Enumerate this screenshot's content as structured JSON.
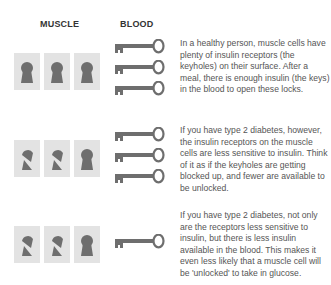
{
  "headers": {
    "muscle": "MUSCLE",
    "blood": "BLOOD"
  },
  "colors": {
    "keyhole": "#6e6e6e",
    "tile": "#e3e3e3",
    "key": "#6e6e6e",
    "text": "#555555"
  },
  "rows": [
    {
      "label": "healthy",
      "keyholes": [
        "open",
        "open",
        "open"
      ],
      "key_count": 3,
      "text": "In a healthy person, muscle cells have plenty of insulin receptors (the keyholes) on their surface. After a meal, there is enough insulin (the keys) in the blood to open these locks."
    },
    {
      "label": "type-2-insulin-resistance",
      "keyholes": [
        "blocked",
        "blocked",
        "open"
      ],
      "key_count": 3,
      "text": "If you have type 2 diabetes, however, the insulin receptors on the muscle cells are less sensitive to insulin. Think of it as if the keyholes are getting blocked up, and fewer are available to be unlocked."
    },
    {
      "label": "type-2-less-insulin",
      "keyholes": [
        "blocked",
        "blocked",
        "open"
      ],
      "key_count": 1,
      "text": "If you have type 2 diabetes, not only are the receptors less sensitive to insulin, but there is less insulin available in the blood. This makes it even less likely that a muscle cell will be 'unlocked' to take in glucose."
    }
  ]
}
